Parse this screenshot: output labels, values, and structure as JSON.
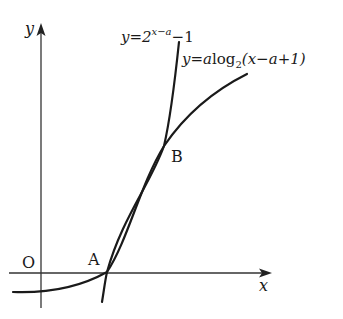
{
  "diagram": {
    "axes": {
      "x_label": "x",
      "y_label": "y",
      "origin_label": "O"
    },
    "points": [
      {
        "label": "A"
      },
      {
        "label": "B"
      }
    ],
    "curves": {
      "exponential": {
        "lhs": "y=2",
        "exponent": "x−a",
        "rhs": "−1"
      },
      "logarithmic": {
        "lhs": "y=",
        "coef": "a",
        "func": "log",
        "base": "2",
        "arg": "(x−a+1)"
      }
    },
    "colors": {
      "stroke": "#1a1a1a",
      "axis": "#333333",
      "background": "#ffffff"
    }
  }
}
